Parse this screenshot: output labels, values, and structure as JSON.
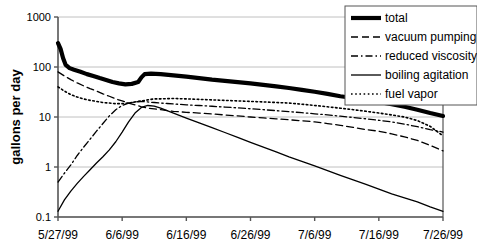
{
  "chart_data": {
    "type": "line",
    "title": "",
    "xlabel": "",
    "ylabel": "gallons per day",
    "yscale": "log",
    "ylim": [
      0.1,
      1000
    ],
    "ytick_labels": [
      "1000",
      "100",
      "10",
      "1",
      "0.1"
    ],
    "ytick_values": [
      1000,
      100,
      10,
      1,
      0.1
    ],
    "xtick_labels": [
      "5/27/99",
      "6/6/99",
      "6/16/99",
      "6/26/99",
      "7/6/99",
      "7/16/99",
      "7/26/99"
    ],
    "xtick_days": [
      0,
      10,
      20,
      30,
      40,
      50,
      60
    ],
    "xlim_days": [
      0,
      60
    ],
    "grid": true,
    "legend_position": "top-right",
    "series": [
      {
        "name": "total",
        "style": "solid-thick",
        "x": [
          0,
          0.4,
          0.8,
          1.2,
          1.8,
          2.5,
          3.5,
          4.5,
          5.5,
          6.5,
          7.5,
          8.5,
          9.5,
          10.5,
          11.5,
          12.5,
          13,
          13.5,
          14.5,
          16,
          18,
          20,
          22,
          24,
          26,
          28,
          30,
          32,
          34,
          36,
          38,
          40,
          42,
          44,
          46,
          48,
          50,
          52,
          54,
          56,
          58,
          60
        ],
        "y": [
          300,
          230,
          150,
          110,
          95,
          88,
          80,
          72,
          66,
          60,
          55,
          50,
          47,
          45,
          46,
          50,
          62,
          72,
          74,
          72,
          68,
          64,
          60,
          56,
          53,
          50,
          47,
          44,
          41,
          38,
          35,
          32,
          29,
          26,
          24,
          22,
          20,
          18,
          16,
          14,
          12,
          10.5
        ]
      },
      {
        "name": "vacuum pumping",
        "style": "dashed",
        "x": [
          0,
          1,
          2,
          3,
          4,
          5,
          6,
          7,
          8,
          9,
          10,
          11,
          12,
          13,
          14,
          15,
          16,
          18,
          20,
          22,
          24,
          26,
          28,
          30,
          32,
          34,
          36,
          38,
          40,
          42,
          44,
          46,
          48,
          50,
          52,
          54,
          56,
          58,
          60
        ],
        "y": [
          80,
          66,
          56,
          48,
          42,
          37,
          33,
          29,
          26,
          23,
          21,
          19,
          17.5,
          16,
          15,
          14.5,
          14,
          13,
          12.4,
          12,
          11.5,
          11,
          10.5,
          10,
          9.6,
          9.2,
          8.8,
          8.4,
          8,
          7.4,
          6.8,
          6.2,
          5.6,
          5.2,
          4.6,
          4.0,
          3.4,
          2.7,
          2.1
        ]
      },
      {
        "name": "reduced viscosity",
        "style": "dash-dot",
        "x": [
          0,
          1,
          2,
          3,
          4,
          5,
          6,
          7,
          8,
          9,
          10,
          11,
          12,
          13,
          14,
          15,
          16,
          17,
          18,
          20,
          22,
          24,
          26,
          28,
          30,
          32,
          34,
          36,
          38,
          40,
          42,
          44,
          46,
          48,
          50,
          52,
          54,
          56,
          58,
          60
        ],
        "y": [
          0.5,
          0.75,
          1.1,
          1.7,
          2.5,
          3.6,
          5.2,
          7.4,
          10.5,
          14,
          17,
          19,
          20,
          20.5,
          20,
          19.5,
          19,
          18.6,
          18.2,
          17.5,
          17,
          16.4,
          15.8,
          15.2,
          14.6,
          14,
          13.4,
          12.8,
          12.2,
          11.6,
          11,
          10.4,
          9.8,
          9.2,
          8.6,
          8.0,
          7.2,
          6.4,
          5.6,
          5.0
        ]
      },
      {
        "name": "boiling agitation",
        "style": "solid-thin",
        "x": [
          0,
          1,
          2,
          3,
          4,
          5,
          6,
          7,
          8,
          9,
          10,
          11,
          12,
          13,
          14,
          15,
          16,
          18,
          20,
          22,
          24,
          26,
          28,
          30,
          32,
          34,
          36,
          38,
          40,
          42,
          44,
          46,
          48,
          50,
          52,
          54,
          56,
          58,
          60
        ],
        "y": [
          0.13,
          0.22,
          0.33,
          0.47,
          0.65,
          0.88,
          1.2,
          1.6,
          2.2,
          3.2,
          5.0,
          8.0,
          12,
          15.5,
          17,
          16.5,
          15,
          12,
          9.5,
          7.6,
          6.1,
          4.9,
          3.9,
          3.1,
          2.5,
          2.0,
          1.6,
          1.3,
          1.05,
          0.85,
          0.68,
          0.55,
          0.45,
          0.36,
          0.29,
          0.24,
          0.2,
          0.16,
          0.13
        ]
      },
      {
        "name": "fuel vapor",
        "style": "dotted",
        "x": [
          0,
          1,
          2,
          3,
          4,
          5,
          6,
          7,
          8,
          9,
          10,
          11,
          12,
          13,
          14,
          15,
          16,
          18,
          20,
          22,
          24,
          26,
          28,
          30,
          32,
          34,
          36,
          38,
          40,
          42,
          44,
          46,
          48,
          50,
          52,
          54,
          56,
          58,
          60
        ],
        "y": [
          40,
          33,
          28,
          25,
          23,
          21.5,
          20.5,
          19.5,
          19,
          18.5,
          18.5,
          19,
          20,
          21,
          22,
          23,
          23,
          23.5,
          23,
          22.5,
          22,
          21.5,
          21,
          20.5,
          20,
          19.5,
          19,
          18,
          17,
          16,
          15,
          14,
          13,
          12,
          11,
          10,
          8.5,
          6.5,
          4.2
        ]
      }
    ]
  },
  "legend": {
    "entries": [
      {
        "label": "total",
        "style": "solid-thick"
      },
      {
        "label": "vacuum pumping",
        "style": "dashed"
      },
      {
        "label": "reduced viscosity",
        "style": "dash-dot"
      },
      {
        "label": "boiling agitation",
        "style": "solid-thin"
      },
      {
        "label": "fuel vapor",
        "style": "dotted"
      }
    ]
  },
  "colors": {
    "line": "#000000",
    "grid": "#c0c0c0",
    "axis": "#555555",
    "background": "#ffffff"
  }
}
